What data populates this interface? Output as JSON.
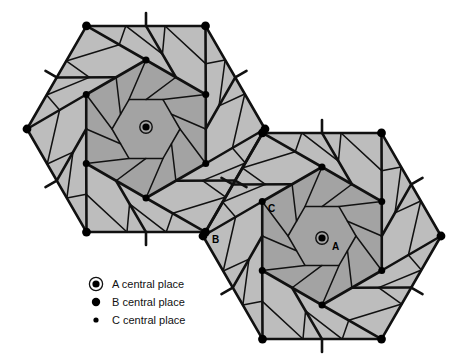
{
  "figure": {
    "background_color": "#ffffff",
    "stroke_color": "#111111",
    "fill_outer": "#bdbdbd",
    "fill_inner": "#a3a3a3",
    "marker_color": "#000000"
  },
  "legend": {
    "items": [
      {
        "symbol": "ringed-dot",
        "label": "A central place",
        "radius": 4.2,
        "ring": true
      },
      {
        "symbol": "large-dot",
        "label": "B central place",
        "radius": 4.2,
        "ring": false
      },
      {
        "symbol": "small-dot",
        "label": "C central place",
        "radius": 2.6,
        "ring": false
      }
    ]
  },
  "annotations": [
    {
      "name": "label-A",
      "text": "A",
      "x": 332,
      "y": 250
    },
    {
      "name": "label-B",
      "text": "B",
      "x": 212,
      "y": 243
    },
    {
      "name": "label-C",
      "text": "C",
      "x": 268,
      "y": 212
    }
  ],
  "systems": [
    {
      "name": "northwest-system",
      "center": {
        "x": 146,
        "y": 129
      },
      "outer_hex_radius": 119,
      "outer_hex_orientation": "flat-top",
      "inner_hex_radius": 69,
      "inner_hex_orientation": "pointy-top",
      "core_hex_radius": 34,
      "a_marker": {
        "x": 146,
        "y": 127
      }
    },
    {
      "name": "southeast-system",
      "center": {
        "x": 322,
        "y": 236
      },
      "outer_hex_radius": 119,
      "outer_hex_orientation": "flat-top",
      "inner_hex_radius": 69,
      "inner_hex_orientation": "pointy-top",
      "core_hex_radius": 34,
      "a_marker": {
        "x": 322,
        "y": 238
      }
    }
  ],
  "chart_data": {
    "type": "diagram",
    "scheme": "central-place-theory",
    "levels": [
      "A",
      "B",
      "C"
    ],
    "a_places": 2,
    "b_places_per_system": 6,
    "c_places_per_system": 6,
    "nesting": "k=3 marketing principle",
    "shading": {
      "outer": "#bdbdbd",
      "inner": "#a3a3a3"
    }
  }
}
